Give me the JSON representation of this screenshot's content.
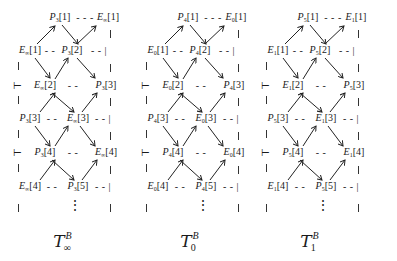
{
  "diagrams": [
    {
      "id": "T_inf",
      "P": "P",
      "P_sub": "3",
      "E": "E",
      "E_sub": "∞",
      "caption": "T",
      "caption_sup": "B",
      "caption_sub": "∞"
    },
    {
      "id": "T_0",
      "P": "P",
      "P_sub": "4",
      "E": "E",
      "E_sub": "0",
      "caption": "T",
      "caption_sup": "B",
      "caption_sub": "0"
    },
    {
      "id": "T_1",
      "P": "P",
      "P_sub": "5",
      "E": "E",
      "E_sub": "1",
      "caption": "T",
      "caption_sup": "B",
      "caption_sub": "1"
    }
  ],
  "indices": {
    "i1": "[1]",
    "i2": "[2]",
    "i3": "[3]",
    "i4": "[4]",
    "i5": "[5]"
  },
  "glyphs": {
    "dash3": "- - -",
    "dash2": "- -",
    "dash2bar": "- - |",
    "tee": "⊢",
    "vdots": "⋮"
  }
}
